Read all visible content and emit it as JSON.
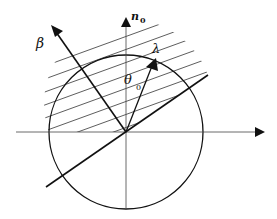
{
  "diagram": {
    "labels": {
      "beta": "β",
      "n": "n",
      "n_sub": "0",
      "lambda": "λ",
      "theta": "θ",
      "theta_sub": "0"
    },
    "colors": {
      "stroke": "#111111",
      "axis": "#444444",
      "background": "#ffffff"
    }
  }
}
